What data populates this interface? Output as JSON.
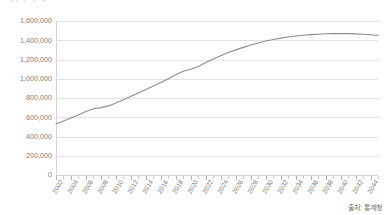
{
  "chart_title": "가구수 추계",
  "source_note": "출처: 통계청",
  "chart_data": {
    "type": "line",
    "title": "가구수 추계",
    "xlabel": "",
    "ylabel": "",
    "ylim": [
      0,
      1600000
    ],
    "ytick_step": 200000,
    "grid": true,
    "legend": "none",
    "line_color": "#8c8c8c",
    "y_ticks": [
      "0",
      "200,000",
      "400,000",
      "600,000",
      "800,000",
      "1,000,000",
      "1,200,000",
      "1,400,000",
      "1,600,000"
    ],
    "y_tick_values": [
      0,
      200000,
      400000,
      600000,
      800000,
      1000000,
      1200000,
      1400000,
      1600000
    ],
    "x_tick_labels": [
      "2002",
      "2004",
      "2006",
      "2008",
      "2010",
      "2012",
      "2014",
      "2016",
      "2018",
      "2020",
      "2022",
      "2024",
      "2026",
      "2028",
      "2030",
      "2032",
      "2034",
      "2036",
      "2038",
      "2040",
      "2042",
      "2044"
    ],
    "x": [
      2002,
      2003,
      2004,
      2005,
      2006,
      2007,
      2008,
      2009,
      2010,
      2011,
      2012,
      2013,
      2014,
      2015,
      2016,
      2017,
      2018,
      2019,
      2020,
      2021,
      2022,
      2023,
      2024,
      2025,
      2026,
      2027,
      2028,
      2029,
      2030,
      2031,
      2032,
      2033,
      2034,
      2035,
      2036,
      2037,
      2038,
      2039,
      2040,
      2041,
      2042,
      2043,
      2044,
      2045
    ],
    "values": [
      530000,
      560000,
      592000,
      625000,
      660000,
      688000,
      700000,
      718000,
      748000,
      782000,
      818000,
      852000,
      888000,
      925000,
      962000,
      1000000,
      1042000,
      1078000,
      1098000,
      1128000,
      1168000,
      1205000,
      1240000,
      1272000,
      1300000,
      1326000,
      1350000,
      1372000,
      1392000,
      1408000,
      1422000,
      1434000,
      1444000,
      1452000,
      1458000,
      1463000,
      1467000,
      1469000,
      1470000,
      1469000,
      1466000,
      1462000,
      1457000,
      1450000
    ],
    "series": [
      {
        "name": "가구수",
        "values": [
          530000,
          560000,
          592000,
          625000,
          660000,
          688000,
          700000,
          718000,
          748000,
          782000,
          818000,
          852000,
          888000,
          925000,
          962000,
          1000000,
          1042000,
          1078000,
          1098000,
          1128000,
          1168000,
          1205000,
          1240000,
          1272000,
          1300000,
          1326000,
          1350000,
          1372000,
          1392000,
          1408000,
          1422000,
          1434000,
          1444000,
          1452000,
          1458000,
          1463000,
          1467000,
          1469000,
          1470000,
          1469000,
          1466000,
          1462000,
          1457000,
          1450000
        ]
      }
    ],
    "annotations": []
  },
  "colors": {
    "line": "#8c8c8c",
    "grid": "#e2e2e4",
    "axis": "#d4d4d6",
    "text": "#808080",
    "background": "#ffffff"
  }
}
